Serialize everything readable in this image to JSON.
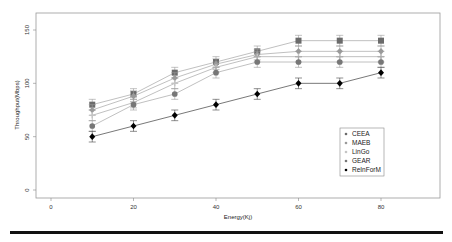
{
  "chart_data": {
    "type": "line",
    "title": "",
    "xlabel": "Energy(Kj)",
    "ylabel": "Throughput(Mbps)",
    "xlim": [
      -5,
      93
    ],
    "ylim": [
      -8,
      165
    ],
    "xticks": [
      0,
      20,
      40,
      60,
      80
    ],
    "yticks": [
      0,
      50,
      100,
      150
    ],
    "x": [
      10,
      20,
      30,
      40,
      50,
      60,
      70,
      80
    ],
    "error_bar": 5,
    "grid": false,
    "legend_position": "right-middle",
    "series": [
      {
        "name": "CEEA",
        "marker": "square",
        "color": "#6b6b6b",
        "values": [
          80,
          90,
          110,
          120,
          130,
          140,
          140,
          140
        ]
      },
      {
        "name": "MAEB",
        "marker": "diamond",
        "color": "#9a9a9a",
        "values": [
          75,
          88,
          105,
          118,
          127,
          130,
          130,
          130
        ]
      },
      {
        "name": "LinGo",
        "marker": "cross",
        "color": "#c4c4c4",
        "values": [
          70,
          82,
          100,
          115,
          125,
          125,
          125,
          125
        ]
      },
      {
        "name": "GEAR",
        "marker": "circle",
        "color": "#777777",
        "values": [
          60,
          80,
          90,
          110,
          120,
          120,
          120,
          120
        ]
      },
      {
        "name": "ReInForM",
        "marker": "diamond",
        "color": "#000000",
        "values": [
          50,
          60,
          70,
          80,
          90,
          100,
          100,
          110
        ]
      }
    ]
  }
}
